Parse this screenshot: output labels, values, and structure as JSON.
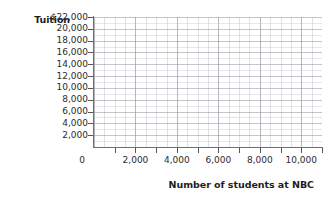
{
  "chart_data": {
    "type": "scatter",
    "title": "",
    "subtitle": "",
    "xlabel": "Number of students at NBC",
    "ylabel": "Tuition",
    "grid": true,
    "legend": null,
    "annotations": [],
    "series": [],
    "x": [],
    "values": [],
    "note": "Empty grid plot — blank graphing worksheet with no plotted data points",
    "xlim": [
      0,
      11000
    ],
    "ylim": [
      0,
      22000
    ],
    "x_tick_labels": [
      "0",
      "2,000",
      "4,000",
      "6,000",
      "8,000",
      "10,000"
    ],
    "x_tick_values": [
      0,
      2000,
      4000,
      6000,
      8000,
      10000
    ],
    "x_minor_tick_step": 1000,
    "y_tick_labels": [
      "$22,000",
      "20,000",
      "18,000",
      "16,000",
      "14,000",
      "12,000",
      "10,000",
      "8,000",
      "6,000",
      "4,000",
      "2,000"
    ],
    "y_tick_values": [
      22000,
      20000,
      18000,
      16000,
      14000,
      12000,
      10000,
      8000,
      6000,
      4000,
      2000
    ],
    "origin_label": "0"
  },
  "axes": {
    "y_title": "Tuition",
    "x_title": "Number of students at NBC"
  },
  "colors": {
    "background": "#ffffff",
    "axis_line": "#6e6e73",
    "grid_major": "#96969e",
    "grid_minor": "#b0b4bc",
    "text": "#2b2b2b",
    "title_text": "#1d1d1d"
  }
}
